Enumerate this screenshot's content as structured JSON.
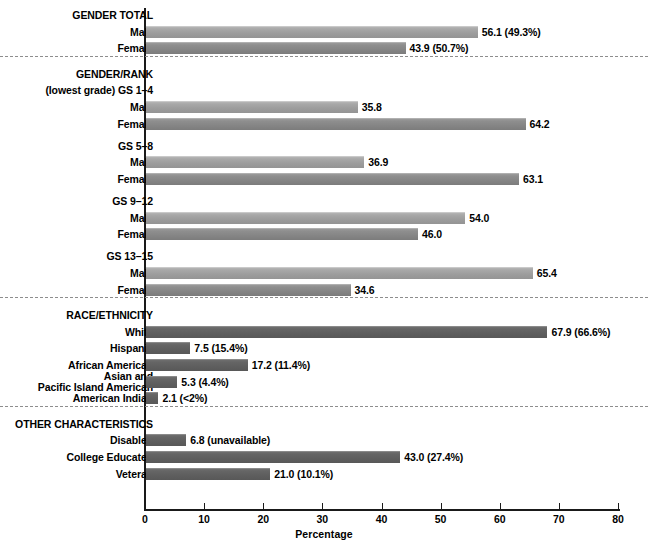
{
  "chart_data": {
    "type": "bar",
    "orientation": "horizontal",
    "title": "",
    "xlabel": "Percentage",
    "ylabel": "",
    "xlim": [
      0,
      80
    ],
    "xticks": [
      0,
      10,
      20,
      30,
      40,
      50,
      60,
      70,
      80
    ],
    "grid": false,
    "legend": "none",
    "sections": [
      {
        "name": "GENDER TOTAL",
        "rows": [
          {
            "label": "Male",
            "value": 56.1,
            "value_label": "56.1 (49.3%)",
            "shade": "light"
          },
          {
            "label": "Female",
            "value": 43.9,
            "value_label": "43.9 (50.7%)",
            "shade": "mid"
          }
        ]
      },
      {
        "name": "GENDER/RANK",
        "subheads": [
          {
            "label": "(lowest grade) GS 1–4",
            "before_row": 0
          },
          {
            "label": "GS 5–8",
            "before_row": 2
          },
          {
            "label": "GS 9–12",
            "before_row": 4
          },
          {
            "label": "GS 13–15",
            "before_row": 6
          }
        ],
        "rows": [
          {
            "label": "Male",
            "value": 35.8,
            "value_label": "35.8",
            "shade": "light"
          },
          {
            "label": "Female",
            "value": 64.2,
            "value_label": "64.2",
            "shade": "mid"
          },
          {
            "label": "Male",
            "value": 36.9,
            "value_label": "36.9",
            "shade": "light"
          },
          {
            "label": "Female",
            "value": 63.1,
            "value_label": "63.1",
            "shade": "mid"
          },
          {
            "label": "Male",
            "value": 54.0,
            "value_label": "54.0",
            "shade": "light"
          },
          {
            "label": "Female",
            "value": 46.0,
            "value_label": "46.0",
            "shade": "mid"
          },
          {
            "label": "Male",
            "value": 65.4,
            "value_label": "65.4",
            "shade": "light"
          },
          {
            "label": "Female",
            "value": 34.6,
            "value_label": "34.6",
            "shade": "mid"
          }
        ]
      },
      {
        "name": "RACE/ETHNICITY",
        "rows": [
          {
            "label": "White",
            "value": 67.9,
            "value_label": "67.9 (66.6%)",
            "shade": "dark"
          },
          {
            "label": "Hispanic",
            "value": 7.5,
            "value_label": "7.5 (15.4%)",
            "shade": "dark"
          },
          {
            "label": "African American",
            "value": 17.2,
            "value_label": "17.2 (11.4%)",
            "shade": "dark"
          },
          {
            "label": "Asian and\nPacific Island American",
            "value": 5.3,
            "value_label": "5.3 (4.4%)",
            "shade": "dark"
          },
          {
            "label": "American Indian",
            "value": 2.1,
            "value_label": "2.1 (<2%)",
            "shade": "dark"
          }
        ]
      },
      {
        "name": "OTHER CHARACTERISTICS",
        "rows": [
          {
            "label": "Disabled",
            "value": 6.8,
            "value_label": "6.8 (unavailable)",
            "shade": "dark"
          },
          {
            "label": "College Educated",
            "value": 43.0,
            "value_label": "43.0 (27.4%)",
            "shade": "dark"
          },
          {
            "label": "Veteran",
            "value": 21.0,
            "value_label": "21.0 (10.1%)",
            "shade": "dark"
          }
        ]
      }
    ],
    "colors": {
      "light_bar": "#a0a0a0",
      "mid_bar": "#888888",
      "dark_bar": "#616161",
      "axis": "#1a1a1a",
      "divider": "#8d8d8d"
    }
  }
}
